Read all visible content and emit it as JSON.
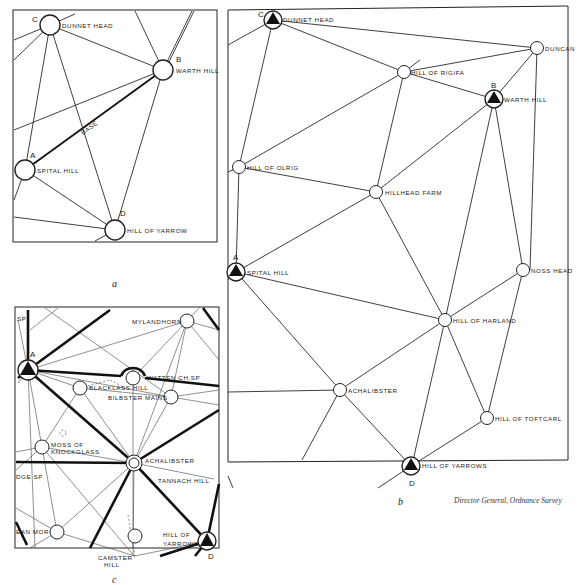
{
  "panels": {
    "a": {
      "caption": "a",
      "base_label": "BASE",
      "stations": [
        {
          "letter": "C",
          "name": "DUNNET HEAD"
        },
        {
          "letter": "B",
          "name": "WARTH HILL"
        },
        {
          "letter": "A",
          "name": "SPITAL HILL"
        },
        {
          "letter": "D",
          "name": "HILL OF YARROW"
        }
      ]
    },
    "b": {
      "caption": "b",
      "stations": [
        {
          "letter": "C",
          "name": "DUNNET HEAD",
          "primary": true
        },
        {
          "letter": "",
          "name": "DUNCAN",
          "primary": false
        },
        {
          "letter": "",
          "name": "HILL OF RIGIFA",
          "primary": false
        },
        {
          "letter": "B",
          "name": "WARTH HILL",
          "primary": true
        },
        {
          "letter": "",
          "name": "HILL OF OLRIG",
          "primary": false
        },
        {
          "letter": "",
          "name": "HILLHEAD FARM",
          "primary": false
        },
        {
          "letter": "A",
          "name": "SPITAL HILL",
          "primary": true
        },
        {
          "letter": "",
          "name": "NOSS HEAD",
          "primary": false
        },
        {
          "letter": "",
          "name": "HILL OF HARLAND",
          "primary": false
        },
        {
          "letter": "",
          "name": "ACHALIBSTER",
          "primary": false
        },
        {
          "letter": "",
          "name": "HILL OF TOFTCARL",
          "primary": false
        },
        {
          "letter": "D",
          "name": "HILL OF YARROWS",
          "primary": true
        }
      ]
    },
    "c": {
      "caption": "c",
      "stations": [
        {
          "letter": "",
          "name": "SP"
        },
        {
          "letter": "A",
          "name": ""
        },
        {
          "letter": "",
          "name": "MYLANDHORN"
        },
        {
          "letter": "",
          "name": "WATTEN CH.SP"
        },
        {
          "letter": "",
          "name": "BLACKLASS HILL"
        },
        {
          "letter": "",
          "name": "BILBSTER MAINS"
        },
        {
          "letter": "",
          "name": "MOSS OF"
        },
        {
          "letter": "",
          "name": "KNOCKGLASS"
        },
        {
          "letter": "",
          "name": "ACHALIBSTER"
        },
        {
          "letter": "",
          "name": "TANNACH HILL"
        },
        {
          "letter": "",
          "name": "DGE SP"
        },
        {
          "letter": "",
          "name": "EAN MOR"
        },
        {
          "letter": "",
          "name": "HILL OF"
        },
        {
          "letter": "",
          "name": "YARROWS"
        },
        {
          "letter": "D",
          "name": ""
        },
        {
          "letter": "",
          "name": "CAMSTER"
        },
        {
          "letter": "",
          "name": "HILL"
        }
      ]
    }
  },
  "credit": "Director General, Ordnance Survey"
}
